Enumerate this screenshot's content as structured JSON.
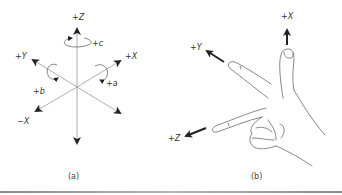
{
  "figure_a": {
    "caption": "(a)",
    "axes": {
      "pos_z": "+Z",
      "pos_x": "+X",
      "pos_y": "+Y",
      "neg_x": "−X"
    },
    "rotations": {
      "c": "+c",
      "a": "+a",
      "b": "+b"
    }
  },
  "figure_b": {
    "caption": "(b)",
    "axes": {
      "pos_x": "+X",
      "pos_y": "+Y",
      "pos_z": "+Z"
    }
  },
  "colors": {
    "axis_line": "#9a9a9a",
    "arrow": "#222222",
    "hand_outline": "#555555",
    "label": "#333333"
  }
}
